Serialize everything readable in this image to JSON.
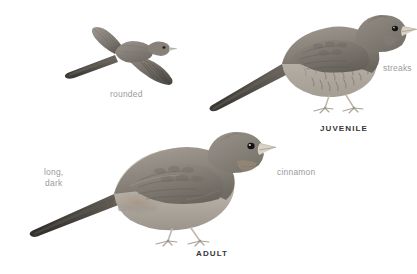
{
  "plate": {
    "background_color": "#ffffff",
    "label_color": "#9b9b9b",
    "caption_color": "#363636",
    "plumage_dark": "#5e5b57",
    "plumage_mid": "#8a857f",
    "plumage_light": "#b8b2ab",
    "belly_color": "#cfc9c1",
    "bill_color": "#d8d2c7",
    "leg_color": "#cac4ba",
    "eye_color": "#1a1a1a"
  },
  "figures": [
    {
      "id": "flight",
      "name": "bird-in-flight-from-above",
      "pose": "flying, dorsal view, wings spread, long tail to left"
    },
    {
      "id": "juvenile",
      "name": "juvenile-bird-perched",
      "pose": "standing, facing right, long tail to left"
    },
    {
      "id": "adult",
      "name": "adult-bird-perched",
      "pose": "standing, facing right, long tail to left"
    }
  ],
  "callouts": [
    {
      "id": "rounded",
      "text": "rounded"
    },
    {
      "id": "streaks",
      "text": "streaks"
    },
    {
      "id": "long_dark",
      "line1": "long,",
      "line2": "dark"
    },
    {
      "id": "cinnamon_low",
      "text": "cinnamon"
    },
    {
      "id": "cinnamon_high",
      "text": "cinnamon"
    }
  ],
  "captions": [
    {
      "id": "juvenile",
      "text": "JUVENILE"
    },
    {
      "id": "adult",
      "text": "ADULT"
    }
  ]
}
